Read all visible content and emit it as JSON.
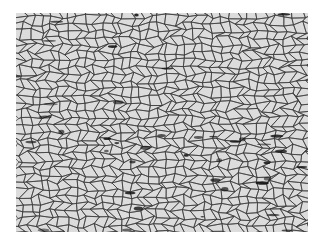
{
  "image": {
    "subject": "metallographic micrograph of polygonal grain structure",
    "colors": {
      "background": "#ffffff",
      "grain": "#dcdcdc",
      "boundary": "#3a3a3a",
      "inclusion": "#111111"
    },
    "grain_size_px": 9,
    "inclusion_count": 40
  }
}
